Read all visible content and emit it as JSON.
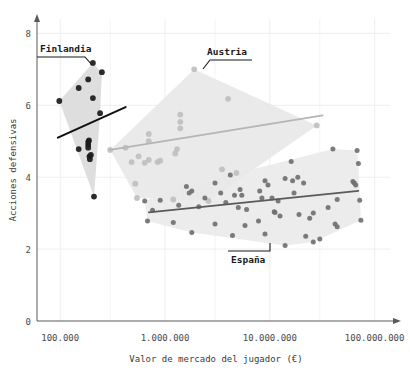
{
  "chart_data": {
    "type": "scatter",
    "title": "",
    "xlabel": "Valor de mercado del jugador (€)",
    "ylabel": "Acciones defensivas",
    "xscale": "log",
    "xlim": [
      60000,
      160000000
    ],
    "ylim": [
      0,
      8.4
    ],
    "xticks": [
      100000,
      1000000,
      10000000,
      100000000
    ],
    "xticklabels": [
      "100.000",
      "1.000.000",
      "10.000.000",
      "100.000.000"
    ],
    "yticks": [
      0,
      2,
      4,
      6,
      8
    ],
    "yticklabels": [
      "0",
      "2",
      "4",
      "6",
      "8"
    ],
    "grid": true,
    "legend": "annotations",
    "annotations": [
      {
        "text": "Finlandia",
        "series": "Finlandia"
      },
      {
        "text": "Austria",
        "series": "Austria"
      },
      {
        "text": "España",
        "series": "España"
      }
    ],
    "series": [
      {
        "name": "Finlandia",
        "color": "#1a1a1a",
        "hull_fill": "#d8d8d8",
        "trend_color": "#111111",
        "trend": [
          [
            95000,
            5.1
          ],
          [
            420000,
            5.95
          ]
        ],
        "points": [
          [
            98000,
            6.12
          ],
          [
            150000,
            6.48
          ],
          [
            205000,
            7.18
          ],
          [
            250000,
            6.92
          ],
          [
            185000,
            6.72
          ],
          [
            205000,
            6.2
          ],
          [
            150000,
            4.78
          ],
          [
            185000,
            4.98
          ],
          [
            185000,
            4.9
          ],
          [
            185000,
            4.82
          ],
          [
            190000,
            4.58
          ],
          [
            192000,
            4.5
          ],
          [
            240000,
            5.78
          ],
          [
            210000,
            3.46
          ],
          [
            188000,
            5.02
          ],
          [
            196000,
            4.62
          ]
        ]
      },
      {
        "name": "Austria",
        "color": "#bfbfbf",
        "hull_fill": "#e6e6e6",
        "trend_color": "#b5b5b5",
        "trend": [
          [
            300000,
            4.76
          ],
          [
            32000000,
            5.72
          ]
        ],
        "points": [
          [
            1900000,
            7.0
          ],
          [
            4000000,
            6.18
          ],
          [
            1400000,
            5.74
          ],
          [
            1400000,
            5.54
          ],
          [
            1400000,
            5.36
          ],
          [
            700000,
            5.2
          ],
          [
            700000,
            5.0
          ],
          [
            1300000,
            4.78
          ],
          [
            1250000,
            4.66
          ],
          [
            420000,
            4.82
          ],
          [
            480000,
            4.42
          ],
          [
            700000,
            4.48
          ],
          [
            850000,
            4.42
          ],
          [
            900000,
            4.46
          ],
          [
            3500000,
            4.22
          ],
          [
            4800000,
            4.12
          ],
          [
            520000,
            3.82
          ],
          [
            540000,
            3.42
          ],
          [
            1200000,
            3.38
          ],
          [
            2600000,
            3.34
          ],
          [
            28000000,
            5.44
          ],
          [
            640000,
            4.4
          ],
          [
            560000,
            4.58
          ],
          [
            300000,
            4.76
          ]
        ]
      },
      {
        "name": "España",
        "color": "#707070",
        "hull_fill": "#e9e9e9",
        "trend_color": "#5a5a5a",
        "trend": [
          [
            700000,
            3.02
          ],
          [
            70000000,
            3.62
          ]
        ],
        "points": [
          [
            640000,
            3.34
          ],
          [
            900000,
            3.36
          ],
          [
            1600000,
            3.74
          ],
          [
            1800000,
            3.62
          ],
          [
            1700000,
            3.56
          ],
          [
            3000000,
            3.84
          ],
          [
            3400000,
            3.56
          ],
          [
            4200000,
            4.06
          ],
          [
            4600000,
            3.5
          ],
          [
            5200000,
            3.66
          ],
          [
            5400000,
            3.5
          ],
          [
            8000000,
            3.62
          ],
          [
            8400000,
            3.42
          ],
          [
            9000000,
            3.9
          ],
          [
            9600000,
            3.78
          ],
          [
            10500000,
            3.42
          ],
          [
            11000000,
            3.04
          ],
          [
            11200000,
            3.02
          ],
          [
            12000000,
            3.34
          ],
          [
            14000000,
            3.96
          ],
          [
            16000000,
            4.44
          ],
          [
            16500000,
            3.9
          ],
          [
            17000000,
            3.56
          ],
          [
            18500000,
            4.0
          ],
          [
            21000000,
            3.84
          ],
          [
            26000000,
            3.0
          ],
          [
            40000000,
            4.78
          ],
          [
            44000000,
            3.38
          ],
          [
            62000000,
            3.88
          ],
          [
            64000000,
            3.84
          ],
          [
            66000000,
            3.78
          ],
          [
            68000000,
            4.74
          ],
          [
            70000000,
            4.38
          ],
          [
            72000000,
            3.36
          ],
          [
            74000000,
            2.8
          ],
          [
            44000000,
            2.62
          ],
          [
            42000000,
            2.7
          ],
          [
            30000000,
            2.28
          ],
          [
            26000000,
            2.2
          ],
          [
            22000000,
            2.36
          ],
          [
            14000000,
            2.1
          ],
          [
            9000000,
            2.42
          ],
          [
            7800000,
            2.78
          ],
          [
            5800000,
            2.66
          ],
          [
            4400000,
            2.38
          ],
          [
            3000000,
            2.7
          ],
          [
            1800000,
            2.46
          ],
          [
            1200000,
            2.74
          ],
          [
            680000,
            2.78
          ],
          [
            760000,
            3.08
          ],
          [
            2100000,
            3.18
          ],
          [
            3800000,
            3.3
          ],
          [
            6000000,
            3.1
          ],
          [
            12500000,
            2.92
          ],
          [
            19000000,
            2.96
          ],
          [
            24000000,
            2.86
          ],
          [
            36000000,
            3.16
          ],
          [
            1350000,
            3.22
          ],
          [
            2400000,
            3.42
          ],
          [
            5000000,
            3.16
          ]
        ]
      }
    ]
  },
  "axis": {
    "y_label": "Acciones defensivas",
    "x_label": "Valor de mercado del jugador (€)",
    "y_ticks": [
      "0",
      "2",
      "4",
      "6",
      "8"
    ],
    "x_ticks": [
      "100.000",
      "1.000.000",
      "10.000.000",
      "100.000.000"
    ]
  },
  "callouts": {
    "finlandia": "Finlandia",
    "austria": "Austria",
    "espana": "España"
  },
  "colors": {
    "finlandia": "#1a1a1a",
    "austria": "#bfbfbf",
    "espana": "#707070",
    "axis": "#5a5a5a",
    "grid": "#eeeeee"
  }
}
